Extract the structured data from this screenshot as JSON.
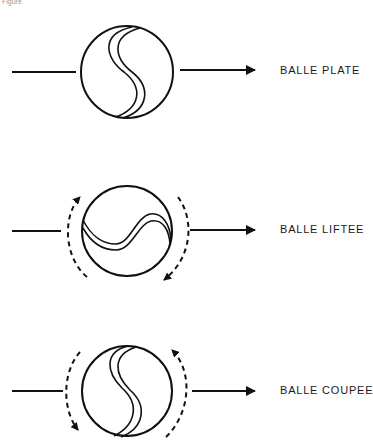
{
  "figure": {
    "caption": "Figure",
    "stroke_color": "#111111",
    "background": "#ffffff"
  },
  "rows": [
    {
      "id": "flat",
      "label": "BALLE PLATE",
      "spin": "none"
    },
    {
      "id": "topspin",
      "label": "BALLE LIFTEE",
      "spin": "topspin"
    },
    {
      "id": "backspin",
      "label": "BALLE COUPEE",
      "spin": "backspin"
    }
  ]
}
